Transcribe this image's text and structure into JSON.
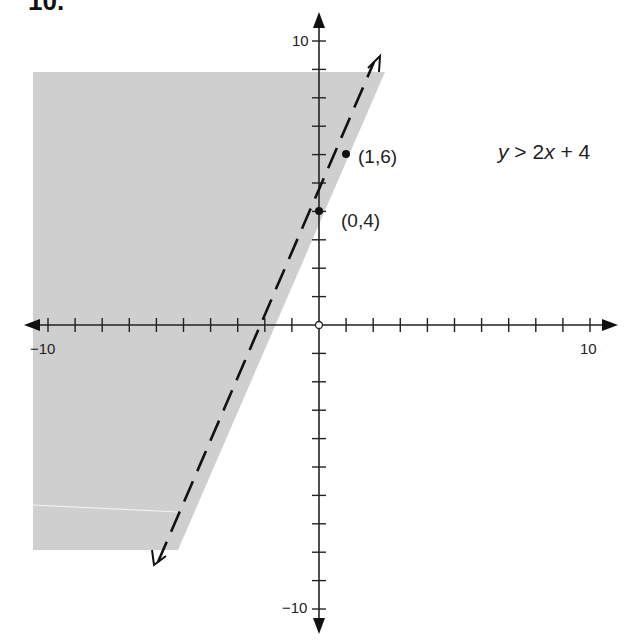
{
  "header": {
    "label": "10."
  },
  "chart_data": {
    "type": "line",
    "title": "",
    "xlabel": "",
    "ylabel": "",
    "xlim": [
      -10,
      10
    ],
    "ylim": [
      -10,
      10
    ],
    "x_tick_labels": [
      "-10",
      "10"
    ],
    "y_tick_labels": [
      "10",
      "-10"
    ],
    "grid": false,
    "series": [
      {
        "name": "y = 2x + 4 (boundary, dashed)",
        "style": "dashed",
        "x": [
          -6,
          2
        ],
        "y": [
          -8,
          8
        ]
      }
    ],
    "points": [
      {
        "x": 0,
        "y": 4,
        "label": "(0,4)"
      },
      {
        "x": 1,
        "y": 6,
        "label": "(1,6)"
      }
    ],
    "shaded_region": "left of / above the line (y > 2x + 4)",
    "annotations": [
      "y > 2x + 4",
      "(1,6)",
      "(0,4)"
    ]
  },
  "labels": {
    "inequality_y": "y",
    "inequality_op": " > 2",
    "inequality_x": "x",
    "inequality_rest": " + 4",
    "point_1": "(1,6)",
    "point_2": "(0,4)",
    "x_min": "−10",
    "x_max": "10",
    "y_max": "10",
    "y_min": "−10"
  }
}
